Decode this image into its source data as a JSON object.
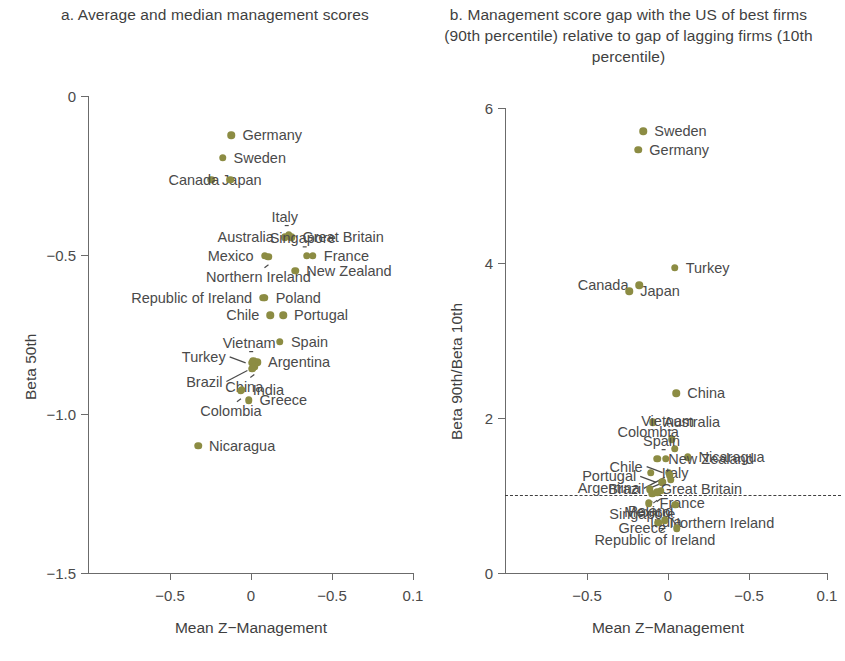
{
  "figure": {
    "marker_color": "#8c8c43",
    "text_color": "#4a4a4a"
  },
  "panel_a": {
    "title": "a. Average and median management scores",
    "xlabel": "Mean Z−Management",
    "ylabel": "Beta 50th",
    "xticks": [
      "−0.5",
      "0",
      "−0.5",
      "0.1"
    ],
    "yticks": [
      "0",
      "−0.5",
      "−1.0",
      "−1.5"
    ]
  },
  "panel_b": {
    "title": "b. Management score gap with the US of best firms (90th percentile) relative to gap of lagging firms (10th percentile)",
    "xlabel": "Mean Z−Management",
    "ylabel": "Beta 90th/Beta 10th",
    "xticks": [
      "−0.5",
      "0",
      "−0.5",
      "0.1"
    ],
    "yticks": [
      "0",
      "2",
      "4",
      "6"
    ],
    "reference_line": 1
  },
  "chart_data": [
    {
      "type": "scatter",
      "panel": "a",
      "title": "a. Average and median management scores",
      "xlabel": "Mean Z−Management",
      "ylabel": "Beta 50th",
      "xlim": [
        -0.72,
        0.13
      ],
      "ylim": [
        -1.62,
        0.06
      ],
      "xtick_values": [
        -0.5,
        0,
        -0.5,
        0.1
      ],
      "xtick_labels": [
        "−0.5",
        "0",
        "−0.5",
        "0.1"
      ],
      "ytick_values": [
        0,
        -0.5,
        -1.0,
        -1.5
      ],
      "ytick_labels": [
        "0",
        "−0.5",
        "−1.0",
        "−1.5"
      ],
      "grid": false,
      "legend": "none",
      "points": [
        {
          "label": "Germany",
          "x": -0.345,
          "y": -0.078,
          "label_pos": "right"
        },
        {
          "label": "Sweden",
          "x": -0.368,
          "y": -0.157,
          "label_pos": "right"
        },
        {
          "label": "Japan",
          "x": -0.398,
          "y": -0.235,
          "label_pos": "right"
        },
        {
          "label": "Canada",
          "x": -0.348,
          "y": -0.235,
          "label_pos": "left"
        },
        {
          "label": "Italy",
          "x": -0.195,
          "y": -0.428,
          "label_pos": "leader-up"
        },
        {
          "label": "Great Britain",
          "x": -0.188,
          "y": -0.437,
          "label_pos": "right"
        },
        {
          "label": "Australia",
          "x": -0.205,
          "y": -0.437,
          "label_pos": "left"
        },
        {
          "label": "Singapore",
          "x": -0.148,
          "y": -0.503,
          "label_pos": "leader-up"
        },
        {
          "label": "France",
          "x": -0.132,
          "y": -0.503,
          "label_pos": "right"
        },
        {
          "label": "Mexico",
          "x": -0.258,
          "y": -0.503,
          "label_pos": "left"
        },
        {
          "label": "Northern Ireland",
          "x": -0.248,
          "y": -0.506,
          "label_pos": "leader-down"
        },
        {
          "label": "New Zealand",
          "x": -0.178,
          "y": -0.556,
          "label_pos": "right"
        },
        {
          "label": "Poland",
          "x": -0.258,
          "y": -0.65,
          "label_pos": "right"
        },
        {
          "label": "Republic of Ireland",
          "x": -0.262,
          "y": -0.65,
          "label_pos": "left"
        },
        {
          "label": "Portugal",
          "x": -0.21,
          "y": -0.713,
          "label_pos": "right"
        },
        {
          "label": "Chile",
          "x": -0.243,
          "y": -0.713,
          "label_pos": "left"
        },
        {
          "label": "Spain",
          "x": -0.218,
          "y": -0.806,
          "label_pos": "right"
        },
        {
          "label": "Argentina",
          "x": -0.278,
          "y": -0.878,
          "label_pos": "right"
        },
        {
          "label": "Vietnam",
          "x": -0.288,
          "y": -0.872,
          "label_pos": "leader-up"
        },
        {
          "label": "Turkey",
          "x": -0.292,
          "y": -0.88,
          "label_pos": "leader-left"
        },
        {
          "label": "China",
          "x": -0.285,
          "y": -0.893,
          "label_pos": "leader-down"
        },
        {
          "label": "Brazil",
          "x": -0.29,
          "y": -0.9,
          "label_pos": "leader-left2"
        },
        {
          "label": "India",
          "x": -0.318,
          "y": -0.975,
          "label_pos": "right"
        },
        {
          "label": "Colombia",
          "x": -0.32,
          "y": -0.978,
          "label_pos": "leader-down"
        },
        {
          "label": "Greece",
          "x": -0.3,
          "y": -1.012,
          "label_pos": "right"
        },
        {
          "label": "Nicaragua",
          "x": -0.432,
          "y": -1.172,
          "label_pos": "right"
        }
      ]
    },
    {
      "type": "scatter",
      "panel": "b",
      "title": "b. Management score gap with the US of best firms (90th percentile) relative to gap of lagging firms (10th percentile)",
      "xlabel": "Mean Z−Management",
      "ylabel": "Beta 90th/Beta 10th",
      "xlim": [
        -0.72,
        0.13
      ],
      "ylim": [
        -0.12,
        6.55
      ],
      "xtick_values": [
        -0.5,
        0,
        -0.5,
        0.1
      ],
      "xtick_labels": [
        "−0.5",
        "0",
        "−0.5",
        "0.1"
      ],
      "ytick_values": [
        0,
        2,
        4,
        6
      ],
      "ytick_labels": [
        "0",
        "2",
        "4",
        "6"
      ],
      "grid": false,
      "legend": "none",
      "reference_line_y": 1,
      "points": [
        {
          "label": "Sweden",
          "x": -0.355,
          "y": 6.22,
          "label_pos": "right"
        },
        {
          "label": "Germany",
          "x": -0.368,
          "y": 5.95,
          "label_pos": "right"
        },
        {
          "label": "Turkey",
          "x": -0.272,
          "y": 4.26,
          "label_pos": "right"
        },
        {
          "label": "Canada",
          "x": -0.365,
          "y": 4.01,
          "label_pos": "left"
        },
        {
          "label": "Japan",
          "x": -0.392,
          "y": 3.92,
          "label_pos": "right"
        },
        {
          "label": "China",
          "x": -0.268,
          "y": 2.46,
          "label_pos": "right"
        },
        {
          "label": "Australia",
          "x": -0.33,
          "y": 2.04,
          "label_pos": "right"
        },
        {
          "label": "Vietnam",
          "x": -0.28,
          "y": 1.8,
          "label_pos": "leader-up"
        },
        {
          "label": "Colombia",
          "x": -0.272,
          "y": 1.66,
          "label_pos": "left-up"
        },
        {
          "label": "Nicaragua",
          "x": -0.238,
          "y": 1.54,
          "label_pos": "right"
        },
        {
          "label": "Spain",
          "x": -0.296,
          "y": 1.52,
          "label_pos": "leader-up"
        },
        {
          "label": "New Zealand",
          "x": -0.318,
          "y": 1.52,
          "label_pos": "right"
        },
        {
          "label": "Chile",
          "x": -0.288,
          "y": 1.32,
          "label_pos": "leader-left"
        },
        {
          "label": "Italy",
          "x": -0.335,
          "y": 1.32,
          "label_pos": "right"
        },
        {
          "label": "Argentina",
          "x": -0.285,
          "y": 1.28,
          "label_pos": "leader-left2"
        },
        {
          "label": "Portugal",
          "x": -0.305,
          "y": 1.18,
          "label_pos": "leader-left"
        },
        {
          "label": "Brazil",
          "x": -0.283,
          "y": 1.22,
          "label_pos": "leader-left3"
        },
        {
          "label": "Great Britain",
          "x": -0.338,
          "y": 1.08,
          "label_pos": "right"
        },
        {
          "label": "Poland",
          "x": -0.309,
          "y": 1.06,
          "label_pos": "leader-down"
        },
        {
          "label": "Mexico",
          "x": -0.318,
          "y": 1.04,
          "label_pos": "leader-down"
        },
        {
          "label": "Singapore",
          "x": -0.331,
          "y": 1.02,
          "label_pos": "leader-down"
        },
        {
          "label": "France",
          "x": -0.341,
          "y": 0.88,
          "label_pos": "right"
        },
        {
          "label": "India",
          "x": -0.27,
          "y": 0.86,
          "label_pos": "left-down"
        },
        {
          "label": "Northern Ireland",
          "x": -0.315,
          "y": 0.6,
          "label_pos": "right"
        },
        {
          "label": "Republic of Ireland",
          "x": -0.298,
          "y": 0.64,
          "label_pos": "leader-down"
        },
        {
          "label": "Greece",
          "x": -0.266,
          "y": 0.52,
          "label_pos": "left"
        }
      ]
    }
  ]
}
